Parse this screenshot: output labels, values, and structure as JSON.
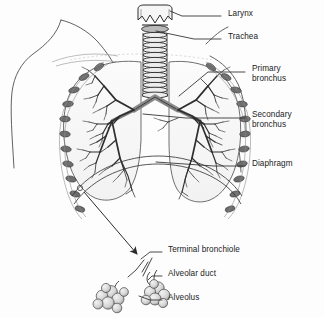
{
  "figure": {
    "background_color": "#fdfdfd",
    "ink_color": "#232323",
    "labels": [
      {
        "id": "larynx",
        "text": "Larynx",
        "x": 228,
        "y": 13
      },
      {
        "id": "trachea",
        "text": "Trachea",
        "x": 228,
        "y": 36
      },
      {
        "id": "primary-bronchus-1",
        "text": "Primary",
        "x": 252,
        "y": 68
      },
      {
        "id": "primary-bronchus-2",
        "text": "bronchus",
        "x": 252,
        "y": 78
      },
      {
        "id": "secondary-bronchus-1",
        "text": "Secondary",
        "x": 252,
        "y": 114
      },
      {
        "id": "secondary-bronchus-2",
        "text": "bronchus",
        "x": 252,
        "y": 124
      },
      {
        "id": "diaphragm",
        "text": "Diaphragm",
        "x": 252,
        "y": 163
      },
      {
        "id": "terminal-bronchiole",
        "text": "Terminal bronchiole",
        "x": 168,
        "y": 249
      },
      {
        "id": "alveolar-duct",
        "text": "Alveolar duct",
        "x": 168,
        "y": 273
      },
      {
        "id": "alveolus",
        "text": "Alveolus",
        "x": 168,
        "y": 297
      }
    ],
    "structures": [
      "torso-outline",
      "shoulder",
      "clavicle",
      "larynx",
      "trachea",
      "carina",
      "left-lung",
      "right-lung",
      "bronchial-tree-left",
      "bronchial-tree-right",
      "rib-markers",
      "diaphragm-dome",
      "magnification-arrow",
      "terminal-bronchiole",
      "alveolar-duct",
      "alveolar-sac-left",
      "alveolar-sac-right"
    ]
  }
}
